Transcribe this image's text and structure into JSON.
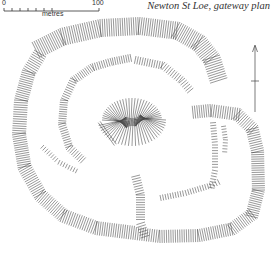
{
  "title": "Newton St Loe, gateway plan",
  "scale_bar": {
    "start_label": "0",
    "end_label": "100",
    "unit_label": "metres",
    "range_m": [
      0,
      100
    ],
    "divisions": 6
  },
  "north_arrow": {
    "direction": "north"
  },
  "plan": {
    "type": "hachured earthwork plan",
    "features": [
      "outer-rampart",
      "inner-enclosure-bank",
      "central-mound",
      "eastern-annex-bank",
      "gateway-entrance",
      "interior-ditches"
    ]
  },
  "colors": {
    "ink": "#333333",
    "background": "#ffffff"
  }
}
